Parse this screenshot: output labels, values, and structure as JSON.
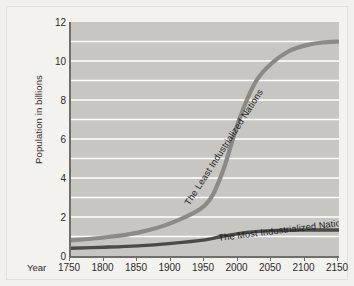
{
  "chart_data": {
    "type": "line",
    "title": "",
    "subtitle": "",
    "xlabel": "Year",
    "ylabel": "Population in billions",
    "xlim": [
      1750,
      2150
    ],
    "ylim": [
      0,
      12
    ],
    "xticks": [
      1750,
      1800,
      1850,
      1900,
      1950,
      2000,
      2050,
      2100,
      2150
    ],
    "yticks": [
      0,
      2,
      4,
      6,
      8,
      10,
      12
    ],
    "xticklabels": [
      "1750",
      "1800",
      "1850",
      "1900",
      "1950",
      "2000",
      "2050",
      "2100",
      "2150"
    ],
    "yticklabels": [
      "0",
      "2",
      "4",
      "6",
      "8",
      "10",
      "12"
    ],
    "grid": true,
    "gridlines_y": [
      1,
      2,
      3,
      4,
      5,
      6,
      7,
      8,
      9,
      10,
      11
    ],
    "grid_color": "#ffffff",
    "plot_background": "#c7c6c3",
    "legend": "none",
    "x": [
      1750,
      1800,
      1850,
      1900,
      1950,
      1975,
      2000,
      2025,
      2050,
      2075,
      2100,
      2125,
      2150
    ],
    "series": [
      {
        "name": "The Least Industrialized Nations",
        "color": "#8b8a87",
        "values": [
          0.8,
          0.95,
          1.2,
          1.7,
          2.6,
          4.2,
          6.9,
          8.9,
          9.9,
          10.5,
          10.8,
          10.95,
          11.0
        ]
      },
      {
        "name": "The Most Industrialized Nations",
        "color": "#4a4a47",
        "values": [
          0.4,
          0.45,
          0.52,
          0.65,
          0.83,
          1.0,
          1.15,
          1.25,
          1.3,
          1.32,
          1.33,
          1.33,
          1.33
        ]
      }
    ],
    "annotations": [
      {
        "text": "The Least Industrialized Nations",
        "rotation": -57
      },
      {
        "text": "The Most Industrialized Nations",
        "rotation": -7
      }
    ]
  },
  "axes": {
    "ylabel": "Population in billions",
    "xlabel": "Year"
  }
}
